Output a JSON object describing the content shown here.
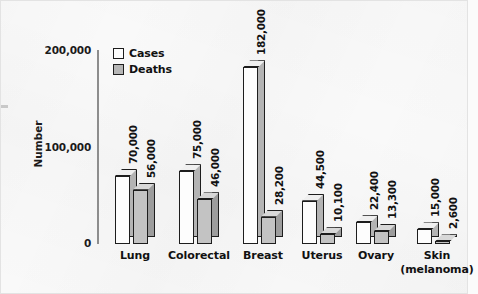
{
  "chart_data": {
    "type": "bar",
    "title": "",
    "subtitle": "",
    "xlabel": "",
    "ylabel": "Number",
    "ylim": [
      0,
      200000
    ],
    "yticks": [
      0,
      100000,
      200000
    ],
    "ytick_labels": [
      "0",
      "100,000",
      "200,000"
    ],
    "grid": false,
    "legend_position": "top-left-inside",
    "style": "3d-isometric-bars",
    "categories": [
      "Lung",
      "Colorectal",
      "Breast",
      "Uterus",
      "Ovary",
      "Skin"
    ],
    "category_sublabels": [
      "",
      "",
      "",
      "",
      "",
      "(melanoma)"
    ],
    "series": [
      {
        "name": "Cases",
        "values": [
          70000,
          75000,
          182000,
          44500,
          22400,
          15000
        ],
        "value_labels": [
          "70,000",
          "75,000",
          "182,000",
          "44,500",
          "22,400",
          "15,000"
        ],
        "color": "#fdfdfd"
      },
      {
        "name": "Deaths",
        "values": [
          56000,
          46000,
          28200,
          10100,
          13300,
          2600
        ],
        "value_labels": [
          "56,000",
          "46,000",
          "28,200",
          "10,100",
          "13,300",
          "2,600"
        ],
        "color": "#b6b6b6"
      }
    ]
  },
  "legend": {
    "items": [
      {
        "label": "Cases",
        "swatch": "legend-swatch-cases"
      },
      {
        "label": "Deaths",
        "swatch": "legend-swatch-deaths"
      }
    ]
  },
  "axis": {
    "y_title": "Number",
    "y_tick_top": "200,000",
    "y_tick_mid": "100,000",
    "y_tick_zero": "0"
  }
}
